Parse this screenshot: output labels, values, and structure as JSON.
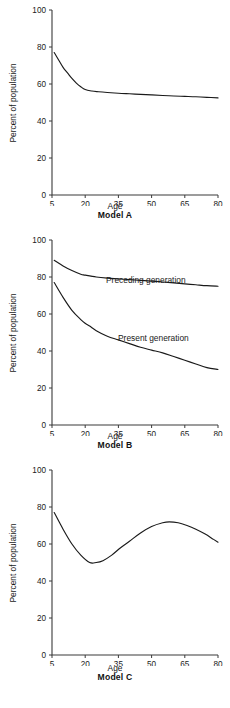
{
  "figure": {
    "background": "#ffffff",
    "line_color": "#1a1a1a",
    "axis_color": "#3b3b3b"
  },
  "panels": [
    {
      "caption": "Model A",
      "xlabel": "Age",
      "ylabel": "Percent of population"
    },
    {
      "caption": "Model B",
      "xlabel": "Age",
      "ylabel": "Percent of population"
    },
    {
      "caption": "Model C",
      "xlabel": "Age",
      "ylabel": "Percent of population"
    }
  ],
  "ticks": {
    "y": [
      "0",
      "20",
      "40",
      "60",
      "80",
      "100"
    ],
    "x": [
      "5",
      "20",
      "35",
      "50",
      "65",
      "80"
    ]
  },
  "annotations": {
    "preceding": "Preceding generation",
    "present": "Present generation"
  },
  "chart_data": [
    {
      "type": "line",
      "title": "Model A",
      "xlabel": "Age",
      "ylabel": "Percent of population",
      "xlim": [
        5,
        80
      ],
      "ylim": [
        0,
        100
      ],
      "xticks": [
        5,
        20,
        35,
        50,
        65,
        80
      ],
      "yticks": [
        0,
        20,
        40,
        60,
        80,
        100
      ],
      "grid": false,
      "legend": "none",
      "series": [
        {
          "name": "Model A curve",
          "x": [
            6,
            8,
            10,
            12,
            14,
            16,
            18,
            20,
            23,
            26,
            30,
            35,
            40,
            45,
            50,
            55,
            60,
            65,
            70,
            75,
            80
          ],
          "values": [
            77,
            73,
            69,
            66,
            63,
            60.5,
            58.5,
            57,
            56.2,
            55.8,
            55.4,
            55.0,
            54.7,
            54.4,
            54.1,
            53.8,
            53.5,
            53.3,
            53.1,
            52.8,
            52.5
          ]
        }
      ]
    },
    {
      "type": "line",
      "title": "Model B",
      "xlabel": "Age",
      "ylabel": "Percent of population",
      "xlim": [
        5,
        80
      ],
      "ylim": [
        0,
        100
      ],
      "xticks": [
        5,
        20,
        35,
        50,
        65,
        80
      ],
      "yticks": [
        0,
        20,
        40,
        60,
        80,
        100
      ],
      "grid": false,
      "legend": "inline-labels",
      "series": [
        {
          "name": "Preceding generation",
          "x": [
            6,
            10,
            14,
            18,
            20,
            25,
            30,
            35,
            40,
            45,
            50,
            55,
            60,
            65,
            70,
            75,
            80
          ],
          "values": [
            89,
            86,
            83.5,
            81.5,
            81,
            80,
            79.4,
            79,
            78.6,
            78.2,
            77.8,
            77.3,
            76.8,
            76.3,
            75.8,
            75.3,
            75
          ]
        },
        {
          "name": "Present generation",
          "x": [
            6,
            10,
            14,
            18,
            20,
            22,
            25,
            30,
            35,
            40,
            45,
            50,
            55,
            60,
            65,
            70,
            75,
            80
          ],
          "values": [
            77,
            69,
            62,
            57,
            55,
            53.5,
            51,
            48,
            46,
            44,
            42,
            40.5,
            39,
            37,
            35,
            33,
            31,
            30
          ]
        }
      ]
    },
    {
      "type": "line",
      "title": "Model C",
      "xlabel": "Age",
      "ylabel": "Percent of population",
      "xlim": [
        5,
        80
      ],
      "ylim": [
        0,
        100
      ],
      "xticks": [
        5,
        20,
        35,
        50,
        65,
        80
      ],
      "yticks": [
        0,
        20,
        40,
        60,
        80,
        100
      ],
      "grid": false,
      "legend": "none",
      "series": [
        {
          "name": "Model C curve",
          "x": [
            6,
            10,
            14,
            18,
            22,
            25,
            28,
            32,
            36,
            40,
            45,
            50,
            55,
            58,
            62,
            66,
            70,
            74,
            78,
            80
          ],
          "values": [
            77,
            68,
            60,
            54,
            50,
            50,
            51,
            54,
            58,
            61.5,
            66,
            69.5,
            71.5,
            72,
            71.5,
            70,
            68,
            65.5,
            62.5,
            61
          ]
        }
      ]
    }
  ]
}
